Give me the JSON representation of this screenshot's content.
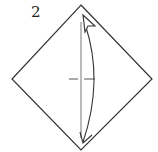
{
  "diagram": {
    "step_number": "2",
    "colors": {
      "paper_edge": "#333333",
      "crease": "#555555",
      "arrow": "#333333",
      "background": "#ffffff"
    },
    "shapes": {
      "diamond": {
        "top": [
          81,
          5
        ],
        "right": [
          152,
          79
        ],
        "bottom": [
          81,
          150
        ],
        "left": [
          12,
          79
        ]
      },
      "crease_mark": {
        "y": 79,
        "x_from": 69,
        "x_to": 95
      },
      "arrow": {
        "from": [
          83,
          142
        ],
        "via": [
          98,
          78
        ],
        "to": [
          84,
          16
        ],
        "head": "hollow-triangle",
        "tail": "open-chevron"
      }
    }
  }
}
